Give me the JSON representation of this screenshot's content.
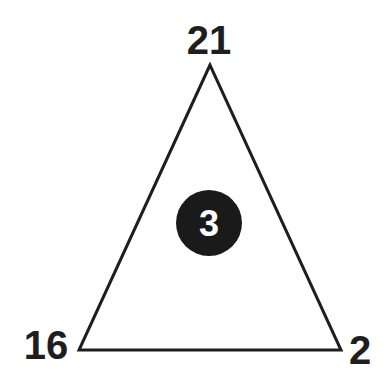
{
  "diagram": {
    "type": "number-triangle-puzzle",
    "colors": {
      "stroke": "#1e1e1e",
      "circle_fill": "#1a1a1a",
      "center_text": "#ffffff",
      "background": "#ffffff"
    },
    "vertices": {
      "top": {
        "value": "21"
      },
      "bottom_left": {
        "value": "16"
      },
      "bottom_right": {
        "value": "2"
      }
    },
    "center": {
      "value": "3"
    }
  }
}
